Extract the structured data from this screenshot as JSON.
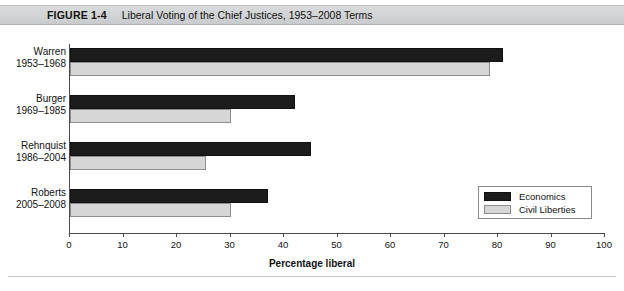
{
  "figure": {
    "number": "FIGURE 1-4",
    "title": "Liberal Voting of the Chief Justices, 1953–2008 Terms"
  },
  "chart_data": {
    "type": "bar",
    "orientation": "horizontal",
    "title": "Liberal Voting of the Chief Justices, 1953–2008 Terms",
    "xlabel": "Percentage liberal",
    "ylabel": "",
    "xlim": [
      0,
      100
    ],
    "xticks": [
      0,
      10,
      20,
      30,
      40,
      50,
      60,
      70,
      80,
      90,
      100
    ],
    "xtick_labels": [
      "0",
      "10",
      "20",
      "30",
      "40",
      "50",
      "60",
      "70",
      "80",
      "90",
      "100"
    ],
    "grid": false,
    "legend_position": "inside-lower-right",
    "categories": [
      "Warren",
      "Burger",
      "Rehnquist",
      "Roberts"
    ],
    "category_years": [
      "1953–1968",
      "1969–1985",
      "1986–2004",
      "2005–2008"
    ],
    "series": [
      {
        "name": "Economics",
        "color": "#1c1c1c",
        "values": [
          81,
          42,
          45,
          37
        ]
      },
      {
        "name": "Civil Liberties",
        "color": "#d6d6d6",
        "values": [
          78.5,
          30,
          25.5,
          30
        ]
      }
    ]
  },
  "legend": {
    "entries": [
      {
        "label": "Economics",
        "swatch": "economics"
      },
      {
        "label": "Civil Liberties",
        "swatch": "civil"
      }
    ]
  }
}
